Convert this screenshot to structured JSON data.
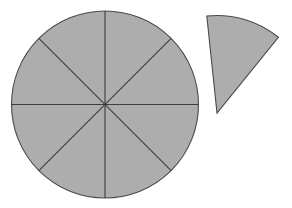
{
  "figure": {
    "background_color": "#ffffff",
    "canvas": {
      "width": 292,
      "height": 208
    }
  },
  "colors": {
    "shape_fill": "#adadad",
    "shape_stroke": "#4a4a4a",
    "divider_stroke": "#3d3d3d",
    "background": "#ffffff"
  },
  "chart_data": {
    "type": "pie",
    "title": "",
    "subtitle": "",
    "xlabel": "",
    "ylabel": "",
    "legend_position": "none",
    "grid": false,
    "categories": [
      "eighth-1",
      "eighth-2",
      "eighth-3",
      "eighth-4",
      "eighth-5",
      "eighth-6",
      "eighth-7",
      "eighth-8"
    ],
    "values": [
      12.5,
      12.5,
      12.5,
      12.5,
      12.5,
      12.5,
      12.5,
      12.5
    ],
    "slice_count": 8,
    "slice_angle_degrees": 45,
    "slice_fraction": "1/8",
    "detached_slice_count": 1,
    "annotations": []
  },
  "circle": {
    "center_x": 105,
    "center_y": 104.5,
    "radius": 93.5,
    "sector_count": 8,
    "dividers": [
      {
        "name": "vertical-divider",
        "angle_degrees": 90
      },
      {
        "name": "horizontal-divider",
        "angle_degrees": 0
      },
      {
        "name": "diagonal-divider-nw-se",
        "angle_degrees": 45
      },
      {
        "name": "diagonal-divider-ne-sw",
        "angle_degrees": 135
      }
    ]
  },
  "detached_wedge": {
    "apex_x": 217,
    "apex_y": 113,
    "radius": 97.5,
    "start_angle_degrees": -96,
    "sweep_degrees": 45,
    "edge_a_end_x": 207,
    "edge_a_end_y": 16,
    "edge_b_end_x": 278,
    "edge_b_end_y": 37
  }
}
